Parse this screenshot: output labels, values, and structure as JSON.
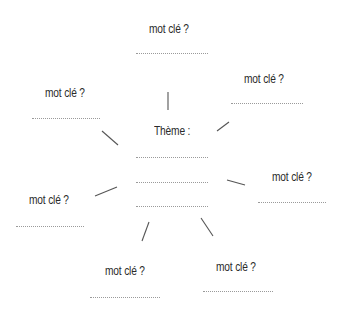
{
  "center": {
    "title": "Thème :",
    "answer_lines": 3
  },
  "keywords": [
    {
      "id": "top",
      "label": "mot clé ?"
    },
    {
      "id": "top-right",
      "label": "mot clé ?"
    },
    {
      "id": "top-left",
      "label": "mot clé ?"
    },
    {
      "id": "right",
      "label": "mot clé ?"
    },
    {
      "id": "left",
      "label": "mot clé ?"
    },
    {
      "id": "bottom-left",
      "label": "mot clé ?"
    },
    {
      "id": "bottom-right",
      "label": "mot clé ?"
    }
  ],
  "colors": {
    "text": "#2b2b2b",
    "lines": "#555555",
    "dots": "#9a9a9a"
  }
}
